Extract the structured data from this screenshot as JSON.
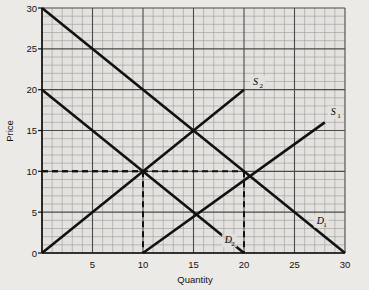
{
  "chart_data": {
    "type": "line",
    "title": "",
    "xlabel": "Quantity",
    "ylabel": "Price",
    "xlim": [
      0,
      30
    ],
    "ylim": [
      0,
      30
    ],
    "xticks": [
      0,
      5,
      10,
      15,
      20,
      25,
      30
    ],
    "xtick_labels": [
      "",
      "5",
      "10",
      "15",
      "20",
      "25",
      "30"
    ],
    "yticks": [
      0,
      5,
      10,
      15,
      20,
      25,
      30
    ],
    "ytick_labels": [
      "0",
      "5",
      "10",
      "15",
      "20",
      "25",
      "30"
    ],
    "grid": "on",
    "grid_minor_step": 1,
    "grid_major_step": 5,
    "legend_position": "inline-labels",
    "series": [
      {
        "name": "D1",
        "label": "D",
        "subscript": "1",
        "kind": "demand",
        "points": [
          [
            0,
            30
          ],
          [
            30,
            0
          ]
        ],
        "style": "solid"
      },
      {
        "name": "D2",
        "label": "D",
        "subscript": "2",
        "kind": "demand",
        "points": [
          [
            0,
            20
          ],
          [
            20,
            0
          ]
        ],
        "style": "solid"
      },
      {
        "name": "S1",
        "label": "S",
        "subscript": "1",
        "kind": "supply",
        "points": [
          [
            10,
            0
          ],
          [
            28,
            16
          ]
        ],
        "style": "solid"
      },
      {
        "name": "S2",
        "label": "S",
        "subscript": "2",
        "kind": "supply",
        "points": [
          [
            0,
            0
          ],
          [
            20,
            20
          ]
        ],
        "style": "solid"
      }
    ],
    "annotations": [
      {
        "name": "equilibrium-1",
        "x": 10,
        "y": 10,
        "guides": [
          "horizontal",
          "vertical"
        ],
        "style": "dashed"
      },
      {
        "name": "equilibrium-2",
        "x": 20,
        "y": 10,
        "guides": [
          "horizontal",
          "vertical"
        ],
        "style": "dashed"
      }
    ],
    "colors": {
      "background": "#eceae6",
      "plot_background": "#e4e2de",
      "grid_minor": "#9a9a98",
      "grid_major": "#4a4a48",
      "curve": "#111111",
      "guide": "#111111",
      "text": "#111111"
    }
  }
}
